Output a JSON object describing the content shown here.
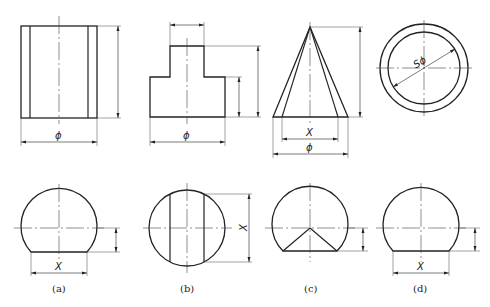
{
  "figure": {
    "colors": {
      "stroke": "#222222",
      "thin": "#444444",
      "background": "#ffffff"
    },
    "panels": [
      {
        "id": "a",
        "caption": "(a)",
        "top_view": "cylinder with two inner silhouette lines",
        "top_dim_label": "ϕ",
        "bottom_view": "truncated circle",
        "bottom_dim_label": "X"
      },
      {
        "id": "b",
        "caption": "(b)",
        "top_view": "stepped T-shape (cylinder on cylinder)",
        "top_dim_label": "ϕ",
        "bottom_view": "circle with two vertical chords",
        "bottom_dim_label": "X"
      },
      {
        "id": "c",
        "caption": "(c)",
        "top_view": "cone with inner lines",
        "top_dim_labels": [
          "X",
          "ϕ"
        ],
        "bottom_view": "truncated circle with V from center",
        "bottom_dim_label": ""
      },
      {
        "id": "d",
        "caption": "(d)",
        "top_view": "sphere with two concentric circles",
        "top_dim_label": "Sϕ",
        "bottom_view": "truncated circle",
        "bottom_dim_label": "X"
      }
    ]
  }
}
